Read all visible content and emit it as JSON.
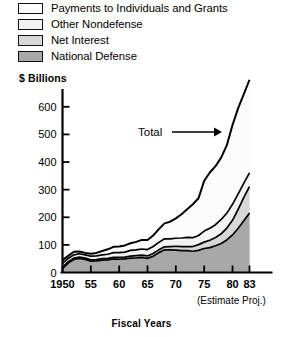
{
  "legend": {
    "items": [
      {
        "label": "Payments to Individuals and Grants",
        "color": "#fcfcfc",
        "icon": "legend-swatch-icon"
      },
      {
        "label": "Other Nondefense",
        "color": "#f2f2f2",
        "icon": "legend-swatch-icon"
      },
      {
        "label": "Net Interest",
        "color": "#d7d7d7",
        "icon": "legend-swatch-icon"
      },
      {
        "label": "National Defense",
        "color": "#a8a8a8",
        "icon": "legend-swatch-icon"
      }
    ]
  },
  "axes": {
    "y_title": "$ Billions",
    "x_title": "Fiscal Years",
    "estimate_note": "(Estimate Proj.)",
    "y_ticks": [
      "0",
      "100",
      "200",
      "300",
      "400",
      "500",
      "600"
    ],
    "x_ticks": [
      "1950",
      "55",
      "60",
      "65",
      "70",
      "75",
      "80",
      "83"
    ]
  },
  "annotation": {
    "total_label": "Total"
  },
  "chart_data": {
    "type": "area",
    "stacked": true,
    "title": "",
    "subtitle": "",
    "xlabel": "Fiscal Years",
    "ylabel": "$ Billions",
    "xlim": [
      1950,
      1983
    ],
    "ylim": [
      0,
      650
    ],
    "y_ticks": [
      0,
      100,
      200,
      300,
      400,
      500,
      600
    ],
    "x_ticks": [
      1950,
      1955,
      1960,
      1965,
      1970,
      1975,
      1980,
      1983
    ],
    "grid": false,
    "legend_position": "above-plot",
    "annotations": [
      {
        "text": "Total",
        "points_to": "top-boundary-of-stack",
        "year": 1976
      }
    ],
    "x": [
      1950,
      1951,
      1952,
      1953,
      1954,
      1955,
      1956,
      1957,
      1958,
      1959,
      1960,
      1961,
      1962,
      1963,
      1964,
      1965,
      1966,
      1967,
      1968,
      1969,
      1970,
      1971,
      1972,
      1973,
      1974,
      1975,
      1976,
      1977,
      1978,
      1979,
      1980,
      1981,
      1982,
      1983
    ],
    "series": [
      {
        "name": "National Defense",
        "color": "#a8a8a8",
        "values": [
          14,
          34,
          47,
          51,
          47,
          41,
          42,
          45,
          46,
          49,
          48,
          49,
          52,
          53,
          55,
          51,
          59,
          72,
          82,
          82,
          81,
          79,
          79,
          77,
          80,
          87,
          90,
          97,
          105,
          118,
          136,
          160,
          187,
          215
        ]
      },
      {
        "name": "Net Interest",
        "color": "#d7d7d7",
        "values": [
          5,
          5,
          5,
          5,
          5,
          5,
          5,
          5,
          5,
          6,
          7,
          7,
          7,
          8,
          8,
          9,
          10,
          10,
          11,
          12,
          14,
          15,
          15,
          17,
          21,
          23,
          27,
          30,
          35,
          43,
          53,
          69,
          85,
          96
        ]
      },
      {
        "name": "Other Nondefense",
        "color": "#f2f2f2",
        "values": [
          14,
          12,
          12,
          12,
          12,
          13,
          13,
          14,
          15,
          17,
          17,
          18,
          21,
          21,
          22,
          23,
          25,
          27,
          29,
          28,
          29,
          31,
          33,
          32,
          33,
          40,
          43,
          46,
          52,
          54,
          58,
          56,
          52,
          50
        ]
      },
      {
        "name": "Payments to Individuals and Grants",
        "color": "#fcfcfc",
        "values": [
          12,
          9,
          11,
          8,
          7,
          9,
          11,
          14,
          18,
          21,
          22,
          24,
          26,
          29,
          33,
          35,
          40,
          48,
          56,
          62,
          72,
          86,
          102,
          121,
          135,
          182,
          202,
          212,
          224,
          246,
          287,
          310,
          322,
          337
        ]
      }
    ],
    "totals": [
      45,
      60,
      75,
      76,
      71,
      68,
      71,
      78,
      84,
      93,
      94,
      98,
      106,
      111,
      118,
      118,
      134,
      157,
      178,
      184,
      196,
      211,
      229,
      247,
      269,
      332,
      362,
      385,
      416,
      461,
      534,
      595,
      646,
      698
    ]
  }
}
